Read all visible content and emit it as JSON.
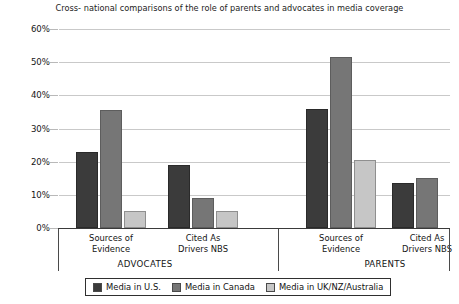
{
  "chart_data": {
    "type": "bar",
    "title": "Cross- national comparisons of the role of parents and advocates in media coverage",
    "xlabel": "",
    "ylabel": "",
    "ylim": [
      0,
      60
    ],
    "ytick_labels": [
      "60%",
      "50%",
      "40%",
      "30%",
      "20%",
      "10%",
      "0%"
    ],
    "ytick_values": [
      60,
      50,
      40,
      30,
      20,
      10,
      0
    ],
    "grid": true,
    "legend_position": "bottom",
    "categories": [
      "Sources of Evidence",
      "Cited As Drivers NBS",
      "Sources of Evidence",
      "Cited As Drivers NBS"
    ],
    "group_labels": [
      "ADVOCATES",
      "PARENTS"
    ],
    "series": [
      {
        "name": "Media in U.S.",
        "color": "#3b3b3b",
        "values": [
          23,
          19,
          36,
          13.5
        ]
      },
      {
        "name": "Media in Canada",
        "color": "#767676",
        "values": [
          35.5,
          9,
          51.5,
          15
        ]
      },
      {
        "name": "Media in UK/NZ/Australia",
        "color": "#c6c6c6",
        "values": [
          5,
          5,
          20.5,
          null
        ]
      }
    ]
  },
  "axis": {
    "ticks": [
      {
        "label": "60%",
        "value": 60
      },
      {
        "label": "50%",
        "value": 50
      },
      {
        "label": "40%",
        "value": 40
      },
      {
        "label": "30%",
        "value": 30
      },
      {
        "label": "20%",
        "value": 20
      },
      {
        "label": "10%",
        "value": 10
      },
      {
        "label": "0%",
        "value": 0
      }
    ]
  },
  "categories": [
    {
      "line1": "Sources of",
      "line2": "Evidence"
    },
    {
      "line1": "Cited As",
      "line2": "Drivers NBS"
    },
    {
      "line1": "Sources of",
      "line2": "Evidence"
    },
    {
      "line1": "Cited As",
      "line2": "Drivers NBS"
    }
  ],
  "groups": [
    {
      "label": "ADVOCATES"
    },
    {
      "label": "PARENTS"
    }
  ],
  "legend": {
    "items": [
      {
        "label": "Media in U.S.",
        "key": "us"
      },
      {
        "label": "Media in Canada",
        "key": "canada"
      },
      {
        "label": "Media in UK/NZ/Australia",
        "key": "uk"
      }
    ]
  }
}
